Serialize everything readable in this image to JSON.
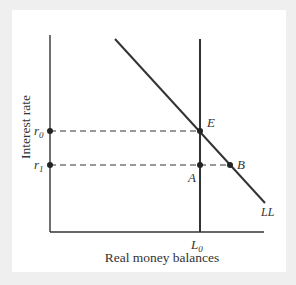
{
  "figure": {
    "y_axis_label": "Interest rate",
    "x_axis_label": "Real money balances",
    "curves": {
      "demand": {
        "label": "LL"
      },
      "supply": {
        "label": "L",
        "subscript": "0"
      }
    },
    "levels": [
      {
        "label": "r",
        "subscript": "0"
      },
      {
        "label": "r",
        "subscript": "1"
      }
    ],
    "points": {
      "E": "E",
      "A": "A",
      "B": "B"
    }
  },
  "colors": {
    "line": "#333333",
    "background": "#ffffff",
    "border": "#efefef"
  }
}
